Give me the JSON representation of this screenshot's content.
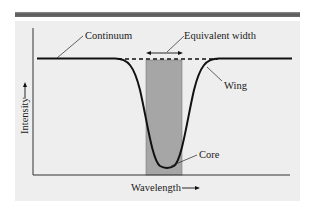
{
  "diagram": {
    "labels": {
      "continuum": "Continuum",
      "equivalent_width": "Equivalent width",
      "wing": "Wing",
      "core": "Core",
      "x_axis": "Wavelength",
      "y_axis": "Intensity"
    },
    "colors": {
      "panel_background": "#eeeeee",
      "shaded_region": "#a6a6a6",
      "curve": "#111111",
      "axis": "#333333",
      "top_bar": "#666666"
    }
  }
}
